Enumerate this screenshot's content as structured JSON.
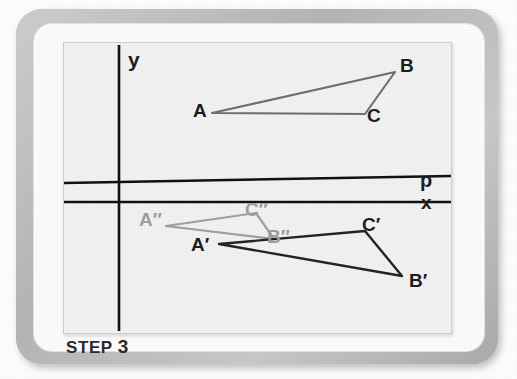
{
  "figure": {
    "caption_prefix": "STEP",
    "caption_number": "3",
    "panel_background": "#f1f1f1",
    "axis_color": "#111111"
  },
  "axes": {
    "y_label": "y",
    "x_label": "x",
    "p_label": "p",
    "y_axis": {
      "x": 55,
      "y1": 2,
      "y2": 288
    },
    "x_axis": {
      "x1": 0,
      "y1": 159,
      "x2": 387,
      "y2": 159
    },
    "p_line": {
      "x1": 0,
      "y1": 140,
      "x2": 387,
      "y2": 133
    }
  },
  "label_positions": {
    "y": {
      "x": 64,
      "y": 10
    },
    "p": {
      "x": 357,
      "y": 136
    },
    "x": {
      "x": 357,
      "y": 160
    },
    "A": {
      "x": 131,
      "y": 62
    },
    "B": {
      "x": 337,
      "y": 18
    },
    "C": {
      "x": 305,
      "y": 64
    },
    "A1": {
      "x": 129,
      "y": 172
    },
    "B1": {
      "x": 346,
      "y": 232
    },
    "C1": {
      "x": 301,
      "y": 179
    },
    "A2": {
      "x": 78,
      "y": 170
    },
    "B2": {
      "x": 196,
      "y": 188
    },
    "C2": {
      "x": 186,
      "y": 161
    }
  },
  "chart_data": {
    "type": "diagram",
    "title": "STEP 3",
    "xlabel": "x",
    "ylabel": "y",
    "extra_axis_label": "p",
    "shapes": [
      {
        "name": "triangle-ABC",
        "stroke": "#6e6e6e",
        "stroke_width": 2.1,
        "vertices": [
          {
            "label": "A",
            "x": 148,
            "y": 70
          },
          {
            "label": "B",
            "x": 331,
            "y": 29
          },
          {
            "label": "C",
            "x": 301,
            "y": 71
          }
        ]
      },
      {
        "name": "triangle-A-prime-B-prime-C-prime",
        "stroke": "#232323",
        "stroke_width": 2.4,
        "vertices": [
          {
            "label": "A′",
            "x": 155,
            "y": 201
          },
          {
            "label": "B′",
            "x": 338,
            "y": 233
          },
          {
            "label": "C′",
            "x": 301,
            "y": 188
          }
        ]
      },
      {
        "name": "triangle-A-dblprime-B-dblprime-C-dblprime",
        "stroke": "#a0a0a0",
        "stroke_width": 2.2,
        "vertices": [
          {
            "label": "A″",
            "x": 102,
            "y": 183
          },
          {
            "label": "B″",
            "x": 210,
            "y": 196
          },
          {
            "label": "C″",
            "x": 192,
            "y": 170
          }
        ]
      }
    ],
    "legend": [],
    "grid": false
  },
  "labels": {
    "A": "A",
    "B": "B",
    "C": "C",
    "A_prime": "A′",
    "B_prime": "B′",
    "C_prime": "C′",
    "A_dblprime": "A″",
    "B_dblprime": "B″",
    "C_dblprime": "C″"
  }
}
